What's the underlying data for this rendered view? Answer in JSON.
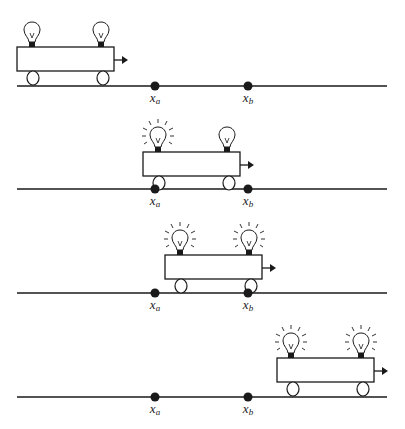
{
  "diagram": {
    "point_labels": {
      "a": "x",
      "a_sub": "a",
      "b": "x",
      "b_sub": "b"
    },
    "point_positions": {
      "x_a": 155,
      "x_b": 248
    },
    "panels": [
      {
        "index": 1,
        "cart_left": 17,
        "track_y": 86,
        "bulb_front_lit": false,
        "bulb_rear_lit": false
      },
      {
        "index": 2,
        "cart_left": 143,
        "track_y": 189,
        "bulb_front_lit": true,
        "bulb_rear_lit": false
      },
      {
        "index": 3,
        "cart_left": 165,
        "track_y": 293,
        "bulb_front_lit": true,
        "bulb_rear_lit": true
      },
      {
        "index": 4,
        "cart_left": 277,
        "track_y": 397,
        "bulb_front_lit": true,
        "bulb_rear_lit": true
      }
    ],
    "colors": {
      "stroke": "#1a1a1a",
      "background": "#ffffff"
    }
  }
}
